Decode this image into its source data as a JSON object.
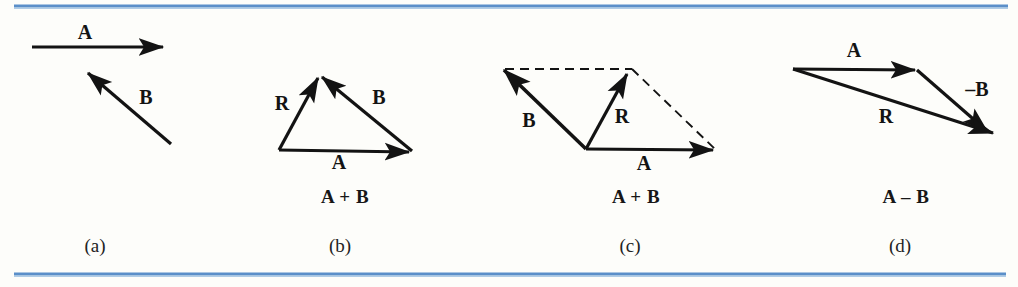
{
  "figure": {
    "background_color": "#fdfdfa",
    "ink_color": "#131313",
    "rule_color": "#5b8fc9",
    "rule_color_light": "#9dc0e2"
  },
  "rules": {
    "top": {
      "name": "top-rule",
      "y": 6,
      "x1": 14,
      "x2": 1008,
      "thickness": 3
    },
    "bottom": {
      "name": "bottom-rule",
      "y": 274,
      "x1": 14,
      "x2": 1006,
      "thickness": 3
    }
  },
  "panels": [
    {
      "id": "a",
      "caption": "(a)",
      "caption_x": 95,
      "caption_y": 248,
      "expression": "",
      "expression_x": 0,
      "expression_y": 0,
      "vectors": [
        {
          "name": "vector-a",
          "label": "A",
          "label_x": 85,
          "label_y": 34,
          "x1": 32,
          "y1": 47,
          "x2": 163,
          "y2": 47,
          "style": "solid",
          "width": 3.2,
          "arrow": "end"
        },
        {
          "name": "vector-b",
          "label": "B",
          "label_x": 146,
          "label_y": 99,
          "x1": 171,
          "y1": 144,
          "x2": 88,
          "y2": 73,
          "style": "solid",
          "width": 3.2,
          "arrow": "end"
        }
      ],
      "dashed": []
    },
    {
      "id": "b",
      "caption": "(b)",
      "caption_x": 340,
      "caption_y": 248,
      "expression": "A + B",
      "expression_x": 345,
      "expression_y": 199,
      "vectors": [
        {
          "name": "vector-a",
          "label": "A",
          "label_x": 339,
          "label_y": 164,
          "x1": 279,
          "y1": 150,
          "x2": 409,
          "y2": 152,
          "style": "solid",
          "width": 3.2,
          "arrow": "end"
        },
        {
          "name": "vector-b",
          "label": "B",
          "label_x": 379,
          "label_y": 99,
          "x1": 412,
          "y1": 151,
          "x2": 322,
          "y2": 77,
          "style": "solid",
          "width": 3.2,
          "arrow": "end"
        },
        {
          "name": "vector-r",
          "label": "R",
          "label_x": 282,
          "label_y": 105,
          "x1": 279,
          "y1": 150,
          "x2": 318,
          "y2": 78,
          "style": "solid",
          "width": 3.2,
          "arrow": "end"
        }
      ],
      "dashed": []
    },
    {
      "id": "c",
      "caption": "(c)",
      "caption_x": 630,
      "caption_y": 248,
      "expression": "A + B",
      "expression_x": 636,
      "expression_y": 199,
      "vectors": [
        {
          "name": "vector-a",
          "label": "A",
          "label_x": 644,
          "label_y": 165,
          "x1": 586,
          "y1": 149,
          "x2": 713,
          "y2": 150,
          "style": "solid",
          "width": 3.2,
          "arrow": "end"
        },
        {
          "name": "vector-b",
          "label": "B",
          "label_x": 529,
          "label_y": 122,
          "x1": 586,
          "y1": 149,
          "x2": 504,
          "y2": 70,
          "style": "solid",
          "width": 3.6,
          "arrow": "end"
        },
        {
          "name": "vector-r",
          "label": "R",
          "label_x": 622,
          "label_y": 118,
          "x1": 586,
          "y1": 149,
          "x2": 627,
          "y2": 74,
          "style": "solid",
          "width": 3.2,
          "arrow": "end"
        }
      ],
      "dashed": [
        {
          "name": "dashed-top-edge",
          "x1": 505,
          "y1": 69,
          "x2": 632,
          "y2": 69
        },
        {
          "name": "dashed-right-edge",
          "x1": 632,
          "y1": 69,
          "x2": 716,
          "y2": 150
        }
      ]
    },
    {
      "id": "d",
      "caption": "(d)",
      "caption_x": 900,
      "caption_y": 248,
      "expression": "A – B",
      "expression_x": 906,
      "expression_y": 199,
      "vectors": [
        {
          "name": "vector-a",
          "label": "A",
          "label_x": 854,
          "label_y": 52,
          "x1": 793,
          "y1": 69,
          "x2": 915,
          "y2": 70,
          "style": "solid",
          "width": 3.2,
          "arrow": "end"
        },
        {
          "name": "vector-minus-b",
          "label": "–B",
          "label_x": 977,
          "label_y": 91,
          "x1": 917,
          "y1": 70,
          "x2": 987,
          "y2": 131,
          "style": "solid",
          "width": 3.2,
          "arrow": "end"
        },
        {
          "name": "vector-r",
          "label": "R",
          "label_x": 886,
          "label_y": 118,
          "x1": 793,
          "y1": 69,
          "x2": 993,
          "y2": 133,
          "style": "solid",
          "width": 3.2,
          "arrow": "end"
        }
      ],
      "dashed": []
    }
  ]
}
